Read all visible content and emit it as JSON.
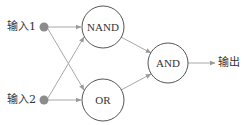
{
  "diagram": {
    "type": "logic-gate-xor-construction",
    "inputs": [
      {
        "label": "输入1"
      },
      {
        "label": "输入2"
      }
    ],
    "gates": [
      {
        "id": "nand",
        "label": "NAND"
      },
      {
        "id": "or",
        "label": "OR"
      },
      {
        "id": "and",
        "label": "AND"
      }
    ],
    "output": {
      "label": "输出"
    },
    "connections": [
      {
        "from": "输入1",
        "to": "NAND"
      },
      {
        "from": "输入1",
        "to": "OR"
      },
      {
        "from": "输入2",
        "to": "NAND"
      },
      {
        "from": "输入2",
        "to": "OR"
      },
      {
        "from": "NAND",
        "to": "AND"
      },
      {
        "from": "OR",
        "to": "AND"
      },
      {
        "from": "AND",
        "to": "输出"
      }
    ],
    "colors": {
      "edge": "#9a9a9a",
      "node_stroke": "#555555",
      "input_dot": "#8c8c8c",
      "text": "#333333"
    }
  }
}
